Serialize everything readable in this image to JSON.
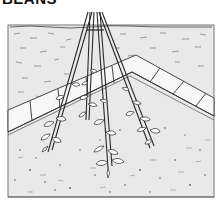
{
  "title": "BEANS",
  "illustration": {
    "subject": "bean plants climbing a teepee of bamboo canes",
    "elements": [
      "frame",
      "grass-ground",
      "paving-path",
      "teepee-canes",
      "bean-plants",
      "soil-bed"
    ],
    "colors": {
      "ground": "#e9e9e9",
      "path": "#f7f7f7",
      "line": "#2a2a2a",
      "speckle": "#555555"
    }
  }
}
